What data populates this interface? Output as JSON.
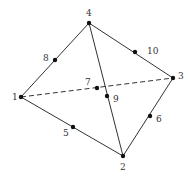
{
  "diagram": {
    "type": "tetrahedral-element",
    "nodes": [
      {
        "id": "1",
        "x": 21,
        "y": 97,
        "label": "1",
        "lx": 12,
        "ly": 100
      },
      {
        "id": "2",
        "x": 123,
        "y": 156,
        "label": "2",
        "lx": 120,
        "ly": 170
      },
      {
        "id": "3",
        "x": 173,
        "y": 78,
        "label": "3",
        "lx": 178,
        "ly": 79
      },
      {
        "id": "4",
        "x": 89,
        "y": 23,
        "label": "4",
        "lx": 86,
        "ly": 16
      },
      {
        "id": "5",
        "x": 73,
        "y": 127,
        "label": "5",
        "lx": 63,
        "ly": 136
      },
      {
        "id": "6",
        "x": 150,
        "y": 116,
        "label": "6",
        "lx": 156,
        "ly": 122
      },
      {
        "id": "7",
        "x": 97,
        "y": 88,
        "label": "7",
        "lx": 85,
        "ly": 85
      },
      {
        "id": "8",
        "x": 55,
        "y": 60,
        "label": "8",
        "lx": 43,
        "ly": 61
      },
      {
        "id": "9",
        "x": 107,
        "y": 96,
        "label": "9",
        "lx": 113,
        "ly": 102
      },
      {
        "id": "10",
        "x": 135,
        "y": 52,
        "label": "10",
        "lx": 147,
        "ly": 54
      }
    ],
    "edges": [
      {
        "from": "1",
        "to": "4",
        "style": "solid"
      },
      {
        "from": "4",
        "to": "3",
        "style": "solid"
      },
      {
        "from": "4",
        "to": "2",
        "style": "solid"
      },
      {
        "from": "1",
        "to": "2",
        "style": "solid"
      },
      {
        "from": "2",
        "to": "3",
        "style": "solid"
      },
      {
        "from": "1",
        "to": "3",
        "style": "dashed"
      }
    ],
    "colors": {
      "line": "#333333",
      "node": "#111111",
      "label": "#333333"
    }
  }
}
